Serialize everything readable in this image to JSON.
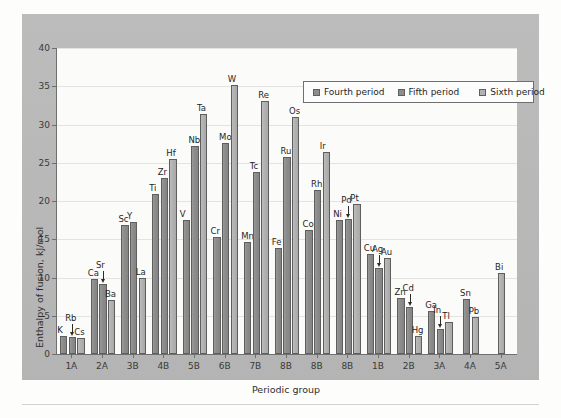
{
  "axes": {
    "ylabel": "Enthalpy of fusion, kJ/mol",
    "xlabel": "Periodic group",
    "yticks": [
      "0",
      "5",
      "10",
      "15",
      "20",
      "25",
      "30",
      "35",
      "40"
    ],
    "ylim": [
      0,
      40
    ]
  },
  "legend": {
    "items": [
      {
        "label": "Fourth period",
        "color": "#8d8d8d"
      },
      {
        "label": "Fifth period",
        "color": "#8d8d8d"
      },
      {
        "label": "Sixth period",
        "color": "#b2b2b2"
      }
    ]
  },
  "chart_data": {
    "type": "bar",
    "title": "",
    "xlabel": "Periodic group",
    "ylabel": "Enthalpy of fusion, kJ/mol",
    "ylim": [
      0,
      40
    ],
    "grid": true,
    "legend_position": "top-right",
    "categories": [
      "1A",
      "2A",
      "3B",
      "4B",
      "5B",
      "6B",
      "7B",
      "8B",
      "8B",
      "8B",
      "1B",
      "2B",
      "3A",
      "4A",
      "5A"
    ],
    "series": [
      {
        "name": "Fourth period",
        "values": [
          2.3,
          9.8,
          16.9,
          20.9,
          17.5,
          15.3,
          14.6,
          13.8,
          16.2,
          17.5,
          13.1,
          7.3,
          5.6,
          null,
          null
        ],
        "labels": [
          "K",
          "Ca",
          "Sc",
          "Ti",
          "V",
          "Cr",
          "Mn",
          "Fe",
          "Co",
          "Ni",
          "Cu",
          "Zn",
          "Ga",
          null,
          null
        ]
      },
      {
        "name": "Fifth period",
        "values": [
          2.2,
          9.2,
          17.2,
          23.0,
          27.2,
          27.6,
          23.8,
          25.7,
          21.5,
          17.6,
          11.3,
          6.2,
          3.3,
          7.2,
          null
        ],
        "labels": [
          "Rb",
          "Sr",
          "Y",
          "Zr",
          "Nb",
          "Mo",
          "Tc",
          "Ru",
          "Rh",
          "Pd",
          "Ag",
          "Cd",
          "In",
          "Sn",
          null
        ]
      },
      {
        "name": "Sixth period",
        "values": [
          2.1,
          7.1,
          10.0,
          25.5,
          31.4,
          35.2,
          33.1,
          31.0,
          26.4,
          19.6,
          12.6,
          2.3,
          4.2,
          4.8,
          10.6
        ],
        "labels": [
          "Cs",
          "Ba",
          "La",
          "Hf",
          "Ta",
          "W",
          "Re",
          "Os",
          "Ir",
          "Pt",
          "Au",
          "Hg",
          "Tl",
          "Pb",
          "Bi"
        ]
      }
    ],
    "arrow_annotations": [
      "Rb",
      "Sr",
      "Pd",
      "Ag",
      "Cd",
      "In"
    ]
  }
}
